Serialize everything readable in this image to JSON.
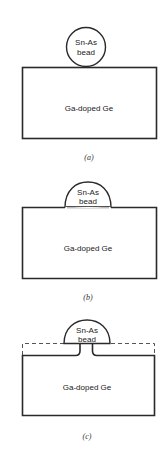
{
  "figure": {
    "panels": [
      {
        "id": "a",
        "caption": "(a)",
        "bead_label_line1": "Sn-As",
        "bead_label_line2": "bead",
        "substrate_label": "Ga-doped Ge",
        "bead_shape": "circle"
      },
      {
        "id": "b",
        "caption": "(b)",
        "bead_label_line1": "Sn-As",
        "bead_label_line2": "bead",
        "substrate_label": "Ga-doped Ge",
        "bead_shape": "melted dome"
      },
      {
        "id": "c",
        "caption": "(c)",
        "bead_label_line1": "Sn-As",
        "bead_label_line2": "bead",
        "substrate_label": "Ga-doped Ge",
        "bead_shape": "dome with etched neck; dashed line marks original surface"
      }
    ],
    "colors": {
      "line": "#2a2a2a",
      "text": "#222222",
      "background": "#ffffff",
      "regrowth": "#bdbdbd"
    }
  }
}
